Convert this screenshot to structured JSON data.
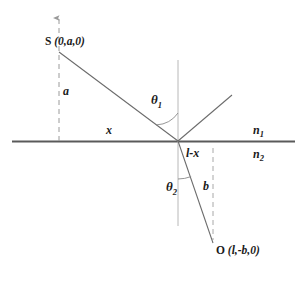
{
  "figure": {
    "type": "optics-ray-diagram",
    "colors": {
      "interface_line": "#5a5a5a",
      "ray_line": "#6b6b6b",
      "dashed_line": "#9a9a9a",
      "text": "#1a1a1a",
      "background": "#ffffff"
    },
    "labels": {
      "source_point": "S",
      "source_coords": "(0,a,0)",
      "observer_point": "O",
      "observer_coords": "(l,-b,0)",
      "height_upper": "a",
      "height_lower": "b",
      "horizontal_left": "x",
      "horizontal_right": "l-x",
      "angle_incidence": "θ",
      "angle_incidence_sub": "1",
      "angle_refraction": "θ",
      "angle_refraction_sub": "2",
      "index_upper": "n",
      "index_upper_sub": "1",
      "index_lower": "n",
      "index_lower_sub": "2"
    },
    "geometry": {
      "interface_y": 141,
      "interface_x_start": 12,
      "interface_x_end": 295,
      "source_x": 59,
      "source_y": 52,
      "incidence_x": 178,
      "incidence_y": 141,
      "observer_x": 213,
      "observer_y": 243,
      "normal_top_y": 60,
      "normal_bottom_y": 226,
      "reflected_end_x": 232,
      "reflected_end_y": 95,
      "left_dashed_top_y": 18,
      "right_dashed_top_y": 148,
      "right_dashed_bottom_y": 240
    }
  }
}
